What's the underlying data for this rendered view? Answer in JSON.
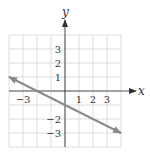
{
  "chart_data": {
    "type": "line",
    "title": "",
    "xlabel": "x",
    "ylabel": "y",
    "xlim": [
      -4,
      4
    ],
    "ylim": [
      -4,
      4
    ],
    "grid": true,
    "x_ticks": [
      {
        "value": -3,
        "label": "−3"
      },
      {
        "value": 1,
        "label": "1"
      },
      {
        "value": 2,
        "label": "2"
      },
      {
        "value": 3,
        "label": "3"
      }
    ],
    "y_ticks": [
      {
        "value": 3,
        "label": "3"
      },
      {
        "value": 2,
        "label": "2"
      },
      {
        "value": 1,
        "label": "1"
      },
      {
        "value": -2,
        "label": "−2"
      },
      {
        "value": -3,
        "label": "−3"
      }
    ],
    "series": [
      {
        "name": "line",
        "equation": "y = -x/2 - 1",
        "x": [
          -4,
          -2,
          0,
          4
        ],
        "y": [
          1,
          0,
          -1,
          -3
        ],
        "arrows": "both"
      }
    ],
    "colors": {
      "grid": "#d6d6d6",
      "axes": "#555555",
      "line": "#8a8a8a",
      "text": "#333333"
    }
  }
}
